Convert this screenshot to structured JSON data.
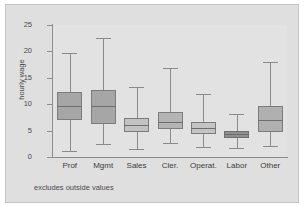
{
  "figure": {
    "footnote": "excludes outside values",
    "background": "#dfdfdf",
    "plot_background": "#e2e2e2",
    "axis_color": "#8d8d8d"
  },
  "chart_data": {
    "type": "box",
    "title": "",
    "xlabel": "",
    "ylabel": "hourly wage",
    "ylim": [
      0,
      25
    ],
    "yticks": [
      0,
      5,
      10,
      15,
      20,
      25
    ],
    "ytick_labels": [
      "0",
      "5",
      "10",
      "15",
      "20",
      "25"
    ],
    "grid": false,
    "legend": "none",
    "note": "excludes outside values",
    "categories": [
      "Prof",
      "Mgmt",
      "Sales",
      "Cler.",
      "Operat.",
      "Labor",
      "Other"
    ],
    "boxes": [
      {
        "category": "Prof",
        "lower_whisker": 1.1,
        "q1": 7.0,
        "median": 9.7,
        "q3": 12.4,
        "upper_whisker": 19.7,
        "fill": "#a6a6a6",
        "edge": "#7c7c7c"
      },
      {
        "category": "Mgmt",
        "lower_whisker": 2.5,
        "q1": 6.2,
        "median": 9.6,
        "q3": 12.7,
        "upper_whisker": 22.6,
        "fill": "#a6a6a6",
        "edge": "#7c7c7c"
      },
      {
        "category": "Sales",
        "lower_whisker": 1.6,
        "q1": 4.7,
        "median": 6.1,
        "q3": 7.4,
        "upper_whisker": 13.2,
        "fill": "#c2c2c2",
        "edge": "#7c7c7c"
      },
      {
        "category": "Cler.",
        "lower_whisker": 2.6,
        "q1": 5.3,
        "median": 6.6,
        "q3": 8.5,
        "upper_whisker": 16.8,
        "fill": "#b4b4b4",
        "edge": "#7c7c7c"
      },
      {
        "category": "Operat.",
        "lower_whisker": 1.9,
        "q1": 4.4,
        "median": 5.5,
        "q3": 6.6,
        "upper_whisker": 12.0,
        "fill": "#c4c4c4",
        "edge": "#7c7c7c"
      },
      {
        "category": "Labor",
        "lower_whisker": 1.7,
        "q1": 3.6,
        "median": 4.4,
        "q3": 5.0,
        "upper_whisker": 8.2,
        "fill": "#8f8f8f",
        "edge": "#6f6f6f"
      },
      {
        "category": "Other",
        "lower_whisker": 2.0,
        "q1": 4.7,
        "median": 7.1,
        "q3": 9.7,
        "upper_whisker": 17.9,
        "fill": "#b0b0b0",
        "edge": "#7c7c7c"
      }
    ]
  }
}
